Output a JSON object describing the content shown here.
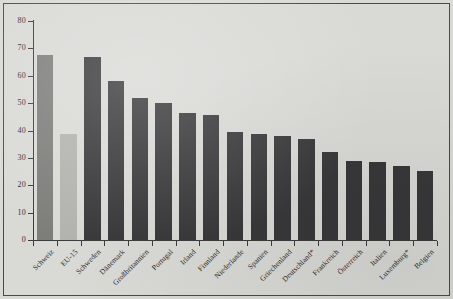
{
  "figure": {
    "background_color": "#d9d9d6",
    "border_color": "#4a4a48",
    "bar_color_dark": "#38383a",
    "bar_color_mid": "#7d7d7c",
    "bar_color_light": "#b2b2ae"
  },
  "chart_data": {
    "type": "bar",
    "title": "",
    "subtitle": "",
    "xlabel": "",
    "ylabel": "",
    "ylim": [
      0,
      80
    ],
    "yticks": [
      0,
      10,
      20,
      30,
      40,
      50,
      60,
      70,
      80
    ],
    "ytick_labels": [
      "0",
      "10",
      "20",
      "30",
      "40",
      "50",
      "60",
      "70",
      "80"
    ],
    "grid": false,
    "legend": null,
    "annotations": [],
    "categories": [
      "Schweiz",
      "EU-15",
      "Schweden",
      "Dänemark",
      "Großbritannien",
      "Portugal",
      "Irland",
      "Finnland",
      "Niederlande",
      "Spanien",
      "Griechenland",
      "Deutschland*",
      "Frankreich",
      "Österreich",
      "Italien",
      "Luxemburg*",
      "Belgien"
    ],
    "values": [
      67.5,
      38.7,
      67.0,
      58.0,
      52.0,
      50.0,
      46.5,
      45.5,
      39.3,
      38.8,
      38.0,
      37.0,
      32.0,
      28.8,
      28.4,
      27.0,
      25.2
    ],
    "bar_styles": [
      "mid",
      "light",
      "dark",
      "dark",
      "dark",
      "dark",
      "dark",
      "dark",
      "dark",
      "dark",
      "dark",
      "dark",
      "dark",
      "dark",
      "dark",
      "dark",
      "dark"
    ]
  }
}
